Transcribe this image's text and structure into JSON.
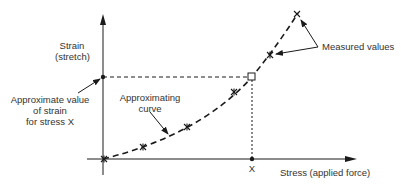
{
  "diagram": {
    "y_axis_label_line1": "Strain",
    "y_axis_label_line2": "(stretch)",
    "x_axis_label": "Stress (applied force)",
    "x_tick_label": "X",
    "approx_value_line1": "Approximate value",
    "approx_value_line2": "of strain",
    "approx_value_line3": "for stress X",
    "approx_curve_line1": "Approximating",
    "approx_curve_line2": "curve",
    "measured_values_label": "Measured values",
    "colors": {
      "ink": "#1a1a1a",
      "text": "#333333",
      "background": "#ffffff"
    }
  }
}
